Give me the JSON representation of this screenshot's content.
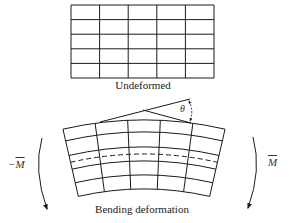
{
  "diagram": {
    "undeformed": {
      "label": "Undeformed",
      "grid": {
        "columns": 5,
        "rows": 5,
        "x": 71,
        "y": 5,
        "width": 143,
        "height": 73
      }
    },
    "deformed": {
      "label": "Bending deformation",
      "columns": 5,
      "rows": 5,
      "neutral_axis": "dashed",
      "angle_label": "θ"
    },
    "moments": {
      "left": {
        "prefix": "−",
        "symbol": "M"
      },
      "right": {
        "prefix": "",
        "symbol": "M"
      }
    },
    "colors": {
      "line": "#1a1a1a",
      "background": "#ffffff"
    }
  }
}
